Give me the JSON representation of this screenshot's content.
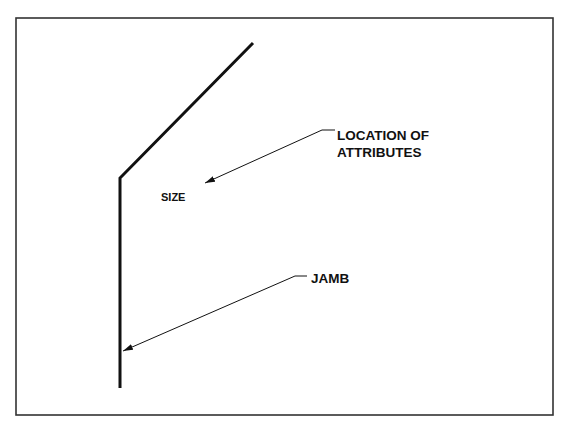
{
  "diagram": {
    "labels": {
      "location_line1": "LOCATION OF",
      "location_line2": "ATTRIBUTES",
      "size": "SIZE",
      "jamb": "JAMB"
    },
    "colors": {
      "stroke": "#111111",
      "background": "#ffffff",
      "frame": "#333333"
    }
  }
}
